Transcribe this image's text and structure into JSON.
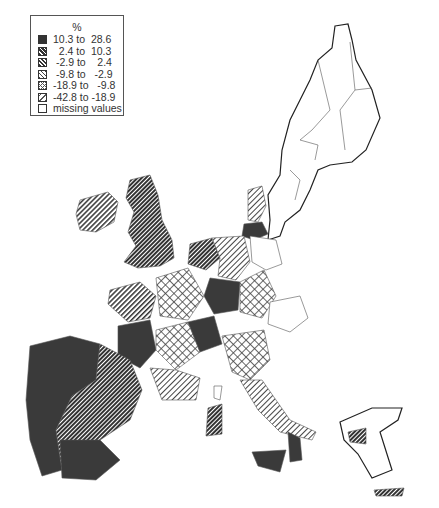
{
  "legend": {
    "title": "%",
    "classes": [
      {
        "label": "10.3 to  28.6",
        "pattern": "solid-dark",
        "range": [
          10.3,
          28.6
        ]
      },
      {
        "label": "  2.4 to  10.3",
        "pattern": "dense-diagonal",
        "range": [
          2.4,
          10.3
        ]
      },
      {
        "label": " -2.9 to    2.4",
        "pattern": "medium-diagonal",
        "range": [
          -2.9,
          2.4
        ]
      },
      {
        "label": " -9.8 to   -2.9",
        "pattern": "light-diagonal",
        "range": [
          -9.8,
          -2.9
        ]
      },
      {
        "label": "-18.9 to   -9.8",
        "pattern": "crosshatch",
        "range": [
          -18.9,
          -9.8
        ]
      },
      {
        "label": "-42.8 to -18.9",
        "pattern": "sparse-diagonal",
        "range": [
          -42.8,
          -18.9
        ]
      },
      {
        "label": "missing values",
        "pattern": "blank",
        "range": null
      }
    ]
  },
  "colors": {
    "dark": "#3a3a3a",
    "line": "#333333",
    "background": "#ffffff"
  }
}
